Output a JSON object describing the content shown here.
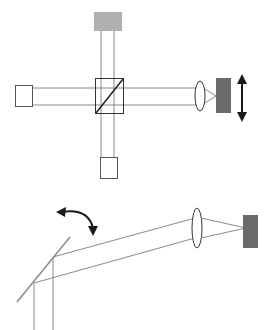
{
  "diagram": {
    "title": "",
    "colors": {
      "beam": "#8a8a8a",
      "outline": "#555555",
      "light_gray_block": "#b0b0b0",
      "dark_gray_block": "#6a6a6a",
      "arrow": "#1a1a1a",
      "mirror": "#8a8a8a"
    },
    "top_setup": {
      "description": "Michelson-style interferometer with beamsplitter cube, three square ports, lens focusing onto a movable detector",
      "components": [
        "top-gray-block",
        "left-square-port",
        "beamsplitter-cube",
        "bottom-square-port",
        "lens",
        "detector-block",
        "vertical-translation-arrow"
      ]
    },
    "bottom_setup": {
      "description": "Tilting mirror redirecting two parallel beams through a lens onto a detector",
      "components": [
        "tilting-mirror",
        "rotation-arrow",
        "lens",
        "detector-block"
      ]
    }
  }
}
